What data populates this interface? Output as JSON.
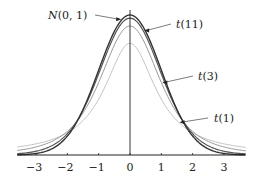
{
  "chart_data": {
    "type": "line",
    "title": "",
    "xlabel": "",
    "ylabel": "",
    "xlim": [
      -3.6,
      3.7
    ],
    "ylim": [
      0,
      0.4
    ],
    "grid": false,
    "legend": "annotations with arrows",
    "x_ticks": [
      -3,
      -2,
      -1,
      0,
      1,
      2,
      3
    ],
    "x_tick_labels": [
      "−3",
      "−2",
      "−1",
      "0",
      "1",
      "2",
      "3"
    ],
    "series": [
      {
        "name": "N(0, 1)",
        "dist": "normal",
        "df": null,
        "peak": 0.3989,
        "color": "#333333",
        "width": 1.4
      },
      {
        "name": "t(11)",
        "dist": "t",
        "df": 11,
        "peak": 0.3925,
        "color": "#555555",
        "width": 1.2
      },
      {
        "name": "t(3)",
        "dist": "t",
        "df": 3,
        "peak": 0.3676,
        "color": "#9a9a9a",
        "width": 1.0
      },
      {
        "name": "t(1)",
        "dist": "t",
        "df": 1,
        "peak": 0.3183,
        "color": "#c4c4c4",
        "width": 1.0
      }
    ],
    "annotations": [
      {
        "text": "N(0, 1)",
        "label_x": 47,
        "label_y": 19,
        "arrow_to_x": -0.25,
        "side": "left"
      },
      {
        "text": "t(11)",
        "label_x": 177,
        "label_y": 28,
        "arrow_to_x": 0.42,
        "side": "right"
      },
      {
        "text": "t(3)",
        "label_x": 199,
        "label_y": 80,
        "arrow_to_x": 1.0,
        "side": "right"
      },
      {
        "text": "t(1)",
        "label_x": 214,
        "label_y": 122,
        "arrow_to_x": 1.55,
        "side": "right"
      }
    ]
  },
  "labels": {
    "normal": "N(0, 1)",
    "t11": "t(11)",
    "t3": "t(3)",
    "t1": "t(1)"
  }
}
